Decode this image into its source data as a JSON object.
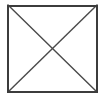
{
  "canvas": {
    "width": 104,
    "height": 99,
    "background_color": "#ffffff"
  },
  "figure": {
    "name": "square-with-diagonals",
    "stroke_color": "#3c3c3c",
    "diagonal_color": "#4a4a4a",
    "fill_color": "none",
    "border_width": 2,
    "diagonal_width": 1.4,
    "square": {
      "left": 8,
      "top": 5,
      "right": 97,
      "bottom": 92,
      "width": 89,
      "height": 87
    },
    "vertices": {
      "top_left": [
        8,
        5
      ],
      "top_right": [
        97,
        5
      ],
      "bottom_right": [
        97,
        92
      ],
      "bottom_left": [
        8,
        92
      ]
    },
    "diagonals": [
      {
        "name": "diagonal-tl-br",
        "from": [
          8,
          5
        ],
        "to": [
          97,
          92
        ]
      },
      {
        "name": "diagonal-tr-bl",
        "from": [
          97,
          5
        ],
        "to": [
          8,
          92
        ]
      }
    ],
    "intersection": [
      52.5,
      48.5
    ]
  }
}
